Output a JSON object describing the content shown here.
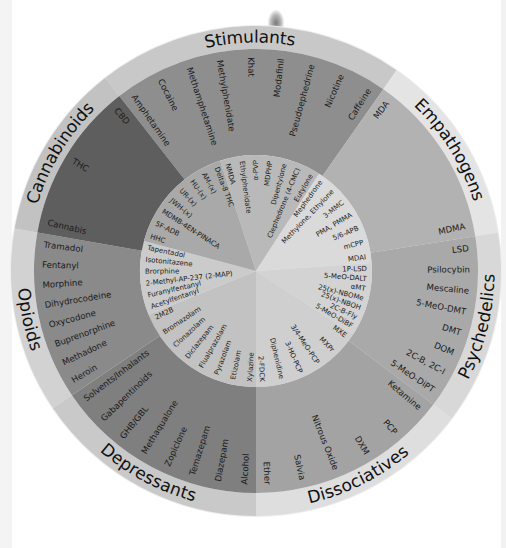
{
  "wheel": {
    "center": [
      256,
      271
    ],
    "radii": {
      "outer": 245,
      "band": 222,
      "mid": 116
    },
    "categories": [
      {
        "name": "Stimulants",
        "start": -38,
        "end": 35,
        "inner_start": -18,
        "inner_end": 33,
        "band_color": "#c8c8c8",
        "outer_color": "#8e8e8e",
        "inner_color": "#b9b9b9",
        "items": [
          "Amphetamine",
          "Cocaine",
          "Methamphetamine",
          "Methylphenidate",
          "Khat",
          "Modafinil",
          "Pseudoephedrine",
          "Nicotine",
          "Caffeine"
        ],
        "inner_items": [
          "NMDA",
          "Ethylphenidate",
          "α-PVP",
          "MDPHP",
          "Dipentylone",
          "Clephedrone (4-CMC)",
          "Eutylone"
        ]
      },
      {
        "name": "Empathogens",
        "start": 35,
        "end": 81,
        "inner_start": 33,
        "inner_end": 86,
        "band_color": "#e4e4e4",
        "outer_color": "#b2b2b2",
        "inner_color": "#dadada",
        "items": [
          "MDA",
          "MDMA"
        ],
        "inner_items": [
          "Mephedrone",
          "Methylone, Ethylone",
          "3-MMC",
          "PMA, PMMA",
          "5/6-APB",
          "mCPP",
          "MDAI"
        ]
      },
      {
        "name": "Psychedelics",
        "start": 81,
        "end": 127,
        "inner_start": 86,
        "inner_end": 123,
        "band_color": "#d8d8d8",
        "outer_color": "#a9a9a9",
        "inner_color": "#d3d3d3",
        "items": [
          "LSD",
          "Psilocybin",
          "Mescaline",
          "5-MeO-DMT",
          "DMT",
          "DOM",
          "2C-B, 2C-I",
          "5-MeO-DiPT"
        ],
        "inner_items": [
          "1P-LSD",
          "5-MeO-DALT",
          "αMT",
          "25(x)-NBOMe",
          "25(x)-NBOH",
          "2C-B-Fly",
          "5-MeO-DiBF"
        ]
      },
      {
        "name": "Dissociatives",
        "start": 127,
        "end": 180,
        "inner_start": 123,
        "inner_end": 180,
        "band_color": "#dedede",
        "outer_color": "#a3a3a3",
        "inner_color": "#cfcfcf",
        "items": [
          "Ketamine",
          "PCP",
          "DXM",
          "Nitrous Oxide",
          "Salvia",
          "Ether"
        ],
        "inner_items": [
          "MXE",
          "MXPr",
          "3/4-MeO-PCP",
          "3-HO-PCP",
          "Diphenidine",
          "2-FDCK"
        ]
      },
      {
        "name": "Depressants",
        "start": 180,
        "end": 236,
        "inner_start": 180,
        "inner_end": 248,
        "band_color": "#c9c9c9",
        "outer_color": "#7f7f7f",
        "inner_color": "#c2c2c2",
        "items": [
          "Alcohol",
          "Diazepam",
          "Temazepam",
          "Zopiclone",
          "Methaqualone",
          "GHB/GBL",
          "Gabapentinoids",
          "Solvents/Inhalants"
        ],
        "inner_items": [
          "Xylazine",
          "Etizolam",
          "Pyrazolam",
          "Flualprazolam",
          "Diclazepam",
          "Clonazolam",
          "Bromazolam",
          "2M2B"
        ]
      },
      {
        "name": "Opioids",
        "start": 236,
        "end": 280,
        "inner_start": 248,
        "inner_end": 285,
        "band_color": "#d2d2d2",
        "outer_color": "#8a8a8a",
        "inner_color": "#cbcbcb",
        "items": [
          "Heroin",
          "Methadone",
          "Buprenorphine",
          "Oxycodone",
          "Dihydrocodeine",
          "Morphine",
          "Fentanyl",
          "Tramadol"
        ],
        "inner_items": [
          "Acetylfentanyl",
          "Furanylfentanyl",
          "2-Methyl-AP-237 (2-MAP)",
          "Brorphine",
          "Isotonitazene",
          "Tapentadol"
        ]
      },
      {
        "name": "Cannabinoids",
        "start": 280,
        "end": 322,
        "inner_start": 285,
        "inner_end": 342,
        "band_color": "#c2c2c2",
        "outer_color": "#5e5e5e",
        "inner_color": "#a9a9a9",
        "items": [
          "Cannabis",
          "THC",
          "CBD"
        ],
        "inner_items": [
          "HHC",
          "5F-ADB",
          "MDMB-4EN-PINACA",
          "JWH-(x)",
          "UR-(x)",
          "HU-(x)",
          "AM-(x)",
          "Delta-8 THC"
        ]
      }
    ]
  }
}
